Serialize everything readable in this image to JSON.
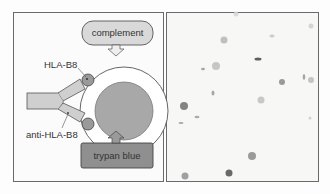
{
  "figure": {
    "left_panel": {
      "title": "Complement-dependent cytotoxicity diagram",
      "labels": {
        "complement": "complement",
        "antigen": "HLA-B8",
        "antibody": "anti-HLA-B8",
        "dye": "trypan blue"
      },
      "colors": {
        "complement_box": "#d9d9d9",
        "trypan_box": "#8f8f8f",
        "cell_nucleus": "#a8a8a8",
        "antibody": "#cfcfcf",
        "antigen": "#9a9a9a"
      }
    },
    "right_panel": {
      "title": "Micrograph of stained cells",
      "cells": [
        {
          "x": 224,
          "y": 40,
          "r": 3.5,
          "shade": "#b5b5b5"
        },
        {
          "x": 216,
          "y": 66,
          "r": 4,
          "shade": "#bdbdbd"
        },
        {
          "x": 258,
          "y": 59,
          "rx": 3.5,
          "ry": 1.5,
          "shade": "#444"
        },
        {
          "x": 203,
          "y": 69,
          "rx": 2,
          "ry": 1.2,
          "shade": "#999"
        },
        {
          "x": 282,
          "y": 82,
          "r": 3,
          "shade": "#8a8a8a"
        },
        {
          "x": 311,
          "y": 80,
          "r": 3,
          "shade": "#bbb"
        },
        {
          "x": 304,
          "y": 77,
          "rx": 1.3,
          "ry": 3,
          "shade": "#999"
        },
        {
          "x": 213,
          "y": 93,
          "rx": 1.5,
          "ry": 2.5,
          "shade": "#999"
        },
        {
          "x": 261,
          "y": 100,
          "r": 3.5,
          "shade": "#c0c0c0"
        },
        {
          "x": 184,
          "y": 106,
          "r": 4,
          "shade": "#707070"
        },
        {
          "x": 197,
          "y": 117,
          "rx": 2.5,
          "ry": 1.3,
          "shade": "#a0a0a0"
        },
        {
          "x": 181,
          "y": 123,
          "rx": 2.5,
          "ry": 1,
          "shade": "#999"
        },
        {
          "x": 252,
          "y": 156,
          "r": 4,
          "shade": "#8a8a8a"
        },
        {
          "x": 185,
          "y": 176,
          "r": 3.5,
          "shade": "#909090"
        },
        {
          "x": 229,
          "y": 173,
          "r": 3.5,
          "shade": "#505050"
        },
        {
          "x": 272,
          "y": 36,
          "rx": 2.5,
          "ry": 1.5,
          "shade": "#c4c4c4"
        },
        {
          "x": 311,
          "y": 26,
          "r": 2.5,
          "shade": "#cfcfcf"
        },
        {
          "x": 236,
          "y": 14,
          "r": 2.5,
          "shade": "#d5d5d5"
        },
        {
          "x": 310,
          "y": 118,
          "r": 1.5,
          "shade": "#ccc"
        }
      ]
    }
  }
}
